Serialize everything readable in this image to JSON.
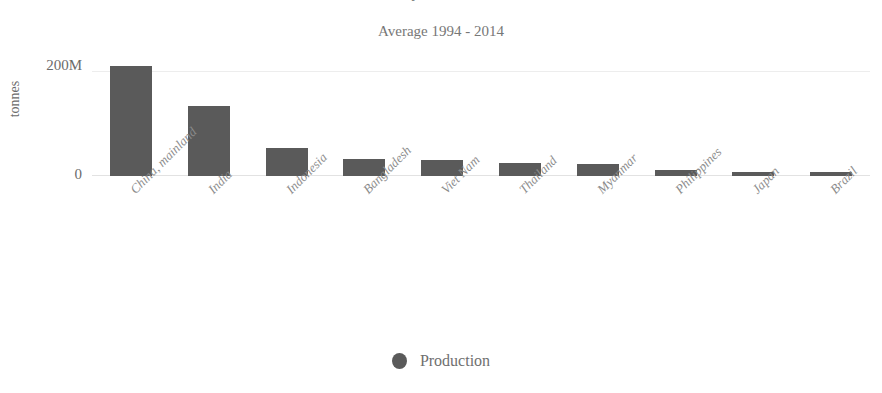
{
  "chart_data": {
    "type": "bar",
    "title": "",
    "subtitle": "Average 1994 - 2014",
    "xlabel": "",
    "ylabel": "tonnes",
    "categories": [
      "China, mainland",
      "India",
      "Indonesia",
      "Bangladesh",
      "Viet Nam",
      "Thailand",
      "Myanmar",
      "Philippines",
      "Japan",
      "Brazil"
    ],
    "series": [
      {
        "name": "Production",
        "values": [
          196000000,
          125000000,
          50000000,
          30000000,
          29000000,
          24000000,
          21000000,
          11000000,
          8000000,
          8000000
        ]
      }
    ],
    "ytick_labels": [
      "200M",
      "0"
    ],
    "ytick_values": [
      200000000,
      0
    ],
    "ylim": [
      0,
      215000000
    ],
    "grid": true,
    "legend_position": "bottom",
    "bar_color": "#5a5a5a",
    "text_color": "#7a7a7a"
  },
  "legend": {
    "items": [
      {
        "label": "Production",
        "marker": "circle",
        "color": "#5a5a5a"
      }
    ]
  },
  "axes": {
    "y_top_label": "200M",
    "y_zero_label": "0",
    "y_axis_title": "tonnes"
  },
  "clipped_title": {
    "text": "Rice Paddy Production"
  }
}
